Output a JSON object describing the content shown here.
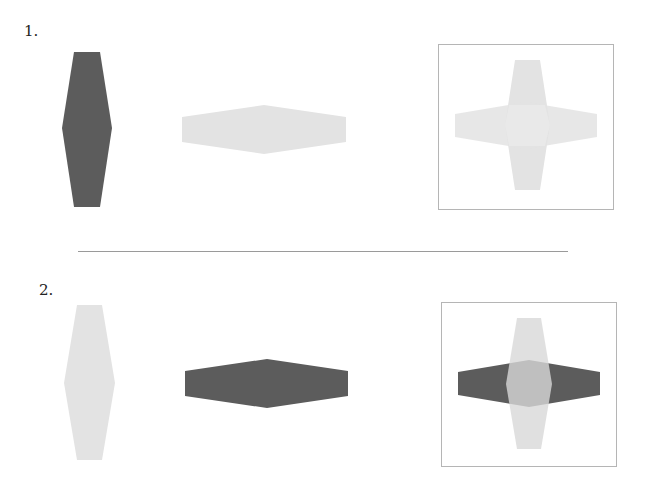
{
  "sections": [
    {
      "label": "1.",
      "vertical_color": "#5c5c5c",
      "horizontal_color": "#e3e3e3",
      "front": "horizontal"
    },
    {
      "label": "2.",
      "vertical_color": "#e3e3e3",
      "horizontal_color": "#5c5c5c",
      "front": "vertical"
    }
  ],
  "colors": {
    "dark": "#5c5c5c",
    "light": "#e3e3e3",
    "box_border": "#b5b5b5",
    "divider": "#9a9a9a"
  }
}
